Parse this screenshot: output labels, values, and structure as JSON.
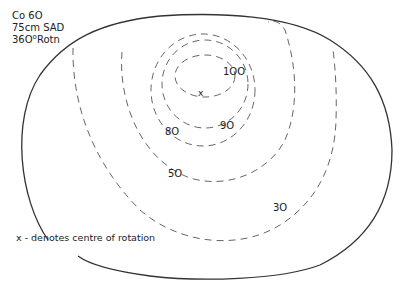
{
  "header": {
    "source": "Co 6O",
    "distance": "75cm SAD",
    "rotation_value": "36O",
    "rotation_degree": "o",
    "rotation_unit": "Rotn"
  },
  "isodose_labels": {
    "l100": "1OO",
    "l90": "9O",
    "l80": "8O",
    "l50": "5O",
    "l30": "3O"
  },
  "centre_marker": "x",
  "legend": "x - denotes  centre of rotation",
  "colors": {
    "outline": "#333333",
    "contour": "#666666"
  }
}
